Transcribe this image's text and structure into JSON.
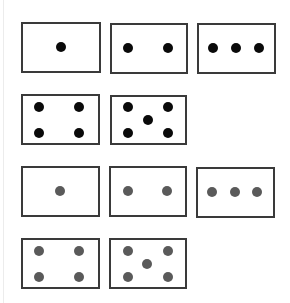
{
  "colors": {
    "border": "#3a3a3a",
    "dot_black": "#0a0a0a",
    "dot_grey": "#5a5a5a",
    "background": "#ffffff"
  },
  "dot_radius": 5,
  "cards": [
    {
      "id": "black-1",
      "count": 1,
      "color": "black",
      "x": 21,
      "y": 22,
      "w": 80,
      "h": 51,
      "dots": [
        [
          40,
          25
        ]
      ]
    },
    {
      "id": "black-2",
      "count": 2,
      "color": "black",
      "x": 110,
      "y": 23,
      "w": 78,
      "h": 51,
      "dots": [
        [
          18,
          25
        ],
        [
          58,
          25
        ]
      ]
    },
    {
      "id": "black-3",
      "count": 3,
      "color": "black",
      "x": 197,
      "y": 23,
      "w": 79,
      "h": 51,
      "dots": [
        [
          16,
          25
        ],
        [
          39,
          25
        ],
        [
          62,
          25
        ]
      ]
    },
    {
      "id": "black-4",
      "count": 4,
      "color": "black",
      "x": 21,
      "y": 94,
      "w": 79,
      "h": 51,
      "dots": [
        [
          18,
          13
        ],
        [
          58,
          13
        ],
        [
          18,
          39
        ],
        [
          58,
          39
        ]
      ]
    },
    {
      "id": "black-5",
      "count": 5,
      "color": "black",
      "x": 110,
      "y": 95,
      "w": 77,
      "h": 50,
      "dots": [
        [
          18,
          12
        ],
        [
          58,
          12
        ],
        [
          38,
          25
        ],
        [
          18,
          38
        ],
        [
          58,
          38
        ]
      ]
    },
    {
      "id": "grey-1",
      "count": 1,
      "color": "grey",
      "x": 21,
      "y": 166,
      "w": 79,
      "h": 51,
      "dots": [
        [
          39,
          25
        ]
      ]
    },
    {
      "id": "grey-2",
      "count": 2,
      "color": "grey",
      "x": 109,
      "y": 166,
      "w": 78,
      "h": 51,
      "dots": [
        [
          19,
          25
        ],
        [
          58,
          25
        ]
      ]
    },
    {
      "id": "grey-3",
      "count": 3,
      "color": "grey",
      "x": 196,
      "y": 167,
      "w": 79,
      "h": 51,
      "dots": [
        [
          16,
          25
        ],
        [
          39,
          25
        ],
        [
          61,
          25
        ]
      ]
    },
    {
      "id": "grey-4",
      "count": 4,
      "color": "grey",
      "x": 21,
      "y": 238,
      "w": 79,
      "h": 51,
      "dots": [
        [
          18,
          13
        ],
        [
          58,
          13
        ],
        [
          18,
          39
        ],
        [
          58,
          39
        ]
      ]
    },
    {
      "id": "grey-5",
      "count": 5,
      "color": "grey",
      "x": 109,
      "y": 238,
      "w": 78,
      "h": 51,
      "dots": [
        [
          19,
          13
        ],
        [
          59,
          13
        ],
        [
          38,
          26
        ],
        [
          19,
          39
        ],
        [
          59,
          39
        ]
      ]
    }
  ]
}
